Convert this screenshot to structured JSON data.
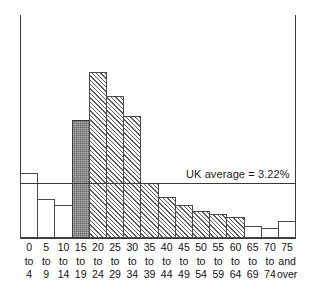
{
  "chart_data": {
    "type": "bar",
    "title": "",
    "subtitle": "",
    "xlabel": "",
    "ylabel": "",
    "grid": false,
    "legend_position": "none",
    "categories": [
      "0 to 4",
      "5 to 9",
      "10 to 14",
      "15 to 19",
      "20 to 24",
      "25 to 29",
      "30 to 34",
      "35 to 39",
      "40 to 44",
      "45 to 49",
      "50 to 54",
      "55 to 59",
      "60 to 64",
      "65 to 69",
      "70 to 74",
      "75 and over"
    ],
    "category_lines": [
      [
        "0",
        "to",
        "4"
      ],
      [
        "5",
        "to",
        "9"
      ],
      [
        "10",
        "to",
        "14"
      ],
      [
        "15",
        "to",
        "19"
      ],
      [
        "20",
        "to",
        "24"
      ],
      [
        "25",
        "to",
        "29"
      ],
      [
        "30",
        "to",
        "34"
      ],
      [
        "35",
        "to",
        "39"
      ],
      [
        "40",
        "to",
        "44"
      ],
      [
        "45",
        "to",
        "49"
      ],
      [
        "50",
        "to",
        "54"
      ],
      [
        "55",
        "to",
        "59"
      ],
      [
        "60",
        "to",
        "64"
      ],
      [
        "65",
        "to",
        "69"
      ],
      [
        "70",
        "to",
        "74"
      ],
      [
        "75",
        "and",
        "over"
      ]
    ],
    "values": [
      3.8,
      2.3,
      1.9,
      6.9,
      9.7,
      8.3,
      7.1,
      3.2,
      2.4,
      1.9,
      1.6,
      1.4,
      1.2,
      0.7,
      0.6,
      1.0
    ],
    "ylim": [
      0,
      13
    ],
    "bar_styles": [
      "plain",
      "plain",
      "plain",
      "highlight",
      "hatched",
      "hatched",
      "hatched",
      "hatched",
      "hatched",
      "hatched",
      "hatched",
      "hatched",
      "hatched",
      "plain",
      "plain",
      "plain"
    ],
    "reference_line": {
      "label": "UK average = 3.22%",
      "value": 3.22
    },
    "colors": {
      "bar_outline": "#4a4a4a",
      "bar_fill": "#ffffff",
      "hatch": "#5a5a5a",
      "highlight_fill": "#5e5e5e",
      "axis": "#3a3a3a",
      "text": "#111111"
    }
  }
}
